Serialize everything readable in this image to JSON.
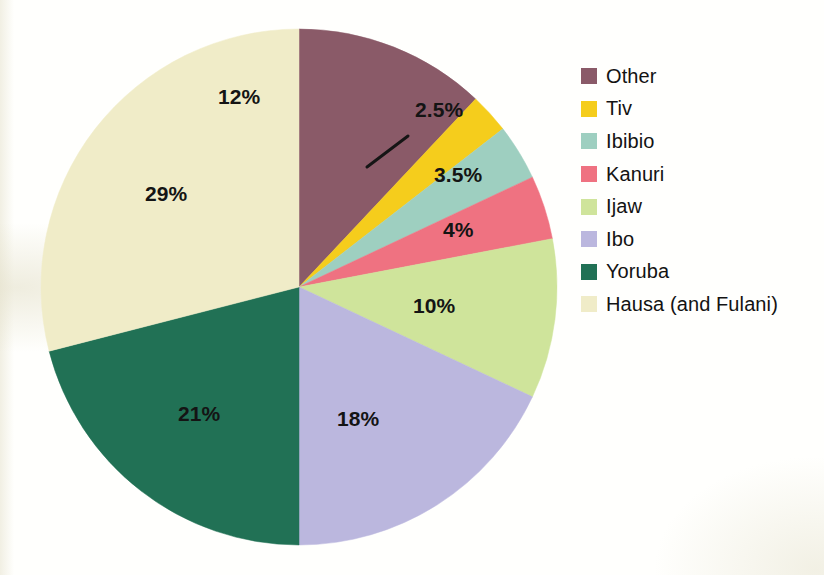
{
  "chart_data": {
    "type": "pie",
    "title": "",
    "subtitle": "",
    "xlabel": "",
    "ylabel": "",
    "legend_position": "right",
    "grid": false,
    "start_angle_deg": 0,
    "direction": "clockwise",
    "units": "percent",
    "total": 100,
    "categories": [
      "Other",
      "Tiv",
      "Ibibio",
      "Kanuri",
      "Ijaw",
      "Ibo",
      "Yoruba",
      "Hausa (and Fulani)"
    ],
    "values": [
      12,
      2.5,
      3.5,
      4,
      10,
      18,
      21,
      29
    ],
    "value_labels": [
      "12%",
      "2.5%",
      "3.5%",
      "4%",
      "10%",
      "18%",
      "21%",
      "29%"
    ],
    "colors": [
      "#8a5a68",
      "#f5cd1c",
      "#9ecfc0",
      "#ef7281",
      "#cfe49b",
      "#bbb7de",
      "#217155",
      "#f0ecc8"
    ],
    "slices": [
      {
        "name": "Other",
        "value": 12,
        "label": "12%",
        "color": "#8a5a68",
        "label_placement": "inside"
      },
      {
        "name": "Tiv",
        "value": 2.5,
        "label": "2.5%",
        "color": "#f5cd1c",
        "label_placement": "outside-leader"
      },
      {
        "name": "Ibibio",
        "value": 3.5,
        "label": "3.5%",
        "color": "#9ecfc0",
        "label_placement": "inside"
      },
      {
        "name": "Kanuri",
        "value": 4,
        "label": "4%",
        "color": "#ef7281",
        "label_placement": "inside"
      },
      {
        "name": "Ijaw",
        "value": 10,
        "label": "10%",
        "color": "#cfe49b",
        "label_placement": "inside"
      },
      {
        "name": "Ibo",
        "value": 18,
        "label": "18%",
        "color": "#bbb7de",
        "label_placement": "inside"
      },
      {
        "name": "Yoruba",
        "value": 21,
        "label": "21%",
        "color": "#217155",
        "label_placement": "inside"
      },
      {
        "name": "Hausa (and Fulani)",
        "value": 29,
        "label": "29%",
        "color": "#f0ecc8",
        "label_placement": "inside"
      }
    ]
  },
  "labels": {
    "other": "12%",
    "tiv": "2.5%",
    "ibibio": "3.5%",
    "kanuri": "4%",
    "ijaw": "10%",
    "ibo": "18%",
    "yoruba": "21%",
    "hausa": "29%"
  },
  "legend": {
    "items": [
      {
        "label": "Other",
        "color": "#8a5a68"
      },
      {
        "label": "Tiv",
        "color": "#f5cd1c"
      },
      {
        "label": "Ibibio",
        "color": "#9ecfc0"
      },
      {
        "label": "Kanuri",
        "color": "#ef7281"
      },
      {
        "label": "Ijaw",
        "color": "#cfe49b"
      },
      {
        "label": "Ibo",
        "color": "#bbb7de"
      },
      {
        "label": "Yoruba",
        "color": "#217155"
      },
      {
        "label": "Hausa (and Fulani)",
        "color": "#f0ecc8"
      }
    ]
  }
}
